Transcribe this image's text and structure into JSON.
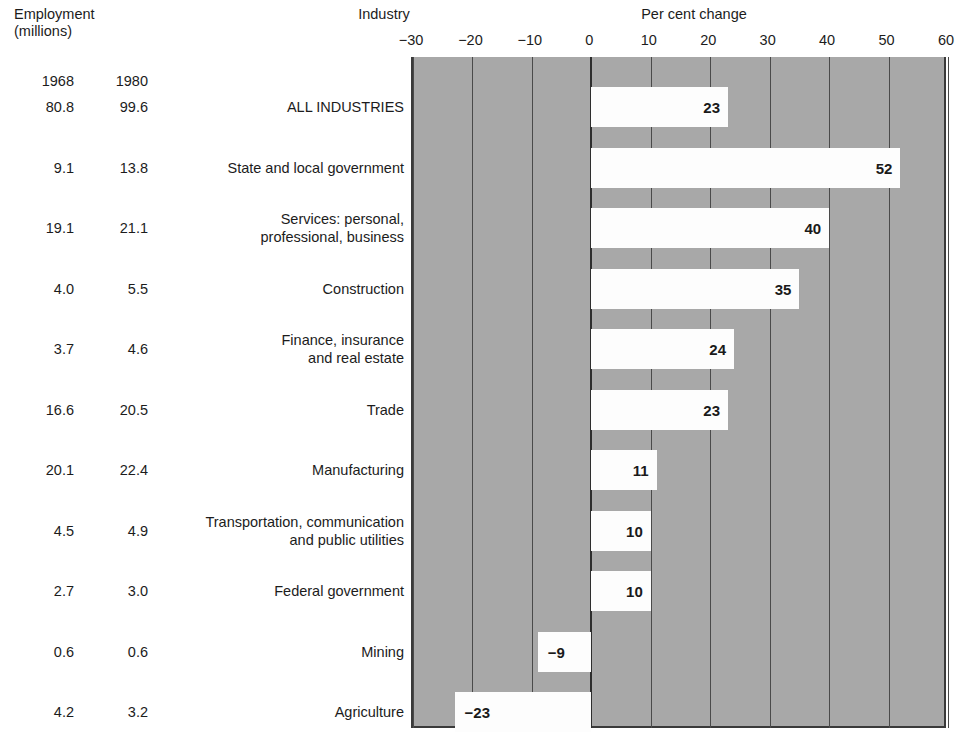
{
  "header": {
    "employment_label": "Employment\n(millions)",
    "industry_label": "Industry",
    "percent_label": "Per cent change",
    "year_col_1": "1968",
    "year_col_2": "1980"
  },
  "chart_data": {
    "type": "bar",
    "orientation": "horizontal",
    "title": "Per cent change",
    "xlabel": "Per cent change",
    "ylabel": "Industry",
    "xlim": [
      -30,
      60
    ],
    "xticks": [
      -30,
      -20,
      -10,
      0,
      10,
      20,
      30,
      40,
      50,
      60
    ],
    "xticklabels": [
      "−30",
      "−20",
      "−10",
      "0",
      "10",
      "20",
      "30",
      "40",
      "50",
      "60"
    ],
    "grid": true,
    "legend": "none",
    "plot_background": "#a8a8a8",
    "bar_color": "#fdfdfd",
    "categories": [
      "ALL  INDUSTRIES",
      "State and local government",
      "Services: personal,\nprofessional, business",
      "Construction",
      "Finance, insurance\nand real estate",
      "Trade",
      "Manufacturing",
      "Transportation, communication\nand public utilities",
      "Federal government",
      "Mining",
      "Agriculture"
    ],
    "values": [
      23,
      52,
      40,
      35,
      24,
      23,
      11,
      10,
      10,
      -9,
      -23
    ],
    "value_labels": [
      "23",
      "52",
      "40",
      "35",
      "24",
      "23",
      "11",
      "10",
      "10",
      "−9",
      "−23"
    ],
    "employment_1968": [
      "80.8",
      "9.1",
      "19.1",
      "4.0",
      "3.7",
      "16.6",
      "20.1",
      "4.5",
      "2.7",
      "0.6",
      "4.2"
    ],
    "employment_1980": [
      "99.6",
      "13.8",
      "21.1",
      "5.5",
      "4.6",
      "20.5",
      "22.4",
      "4.9",
      "3.0",
      "0.6",
      "3.2"
    ]
  }
}
